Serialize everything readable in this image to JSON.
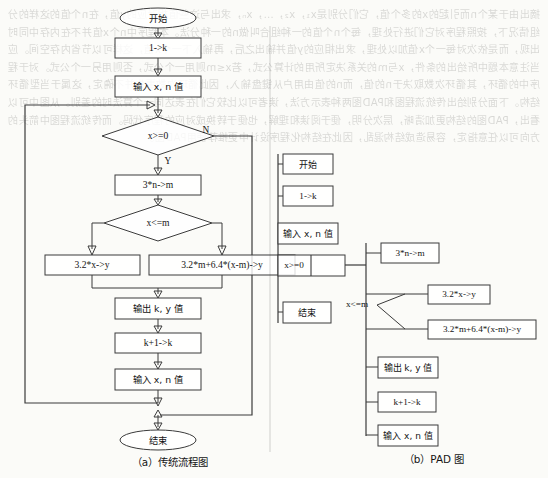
{
  "page": {
    "width": 548,
    "height": 478,
    "background_color": "#fbfbf8",
    "ink_color": "#3b3b3b",
    "bleed_through_text": "摘出由于某个n而引起的x的多个值，它们分别是x₁，x₂，…，xₙ，求出与这些值相对应的y值，在n个值的这样的分组情况下，按照程序对它们进行处理，每个n个值的一种组合叫做n的一种分法。本程序中n个x值并不在内存中同时出现，而是依次对每一个x值加以处理，求出相应的y值并输出之后，再输入下一个x值，这样可以节省内存空间。应当注意本题中所给出的条件，x与m的关系决定所用的计算公式，若x≤m则用一个公式，否则用另一个公式。对于程序中的循环，其循环次数取决于n的值，而n的值由用户从键盘输入，因此循环次数事先并不确定，这属于当型循环结构。下面分别给出传统流程图和PAD图两种表示方法，读者可以比较它们在表达同一个算法时的差别。从图中可以看出，PAD图的结构更加清晰，层次分明，便于阅读和理解，也便于转换成对应的程序代码。而传统流程图中箭头的方向可以任意指定，容易造成结构混乱，因此在结构化程序设计中更推荐使用PAD图。"
  },
  "flowchart": {
    "caption": "（a）传统流程图",
    "nodes": [
      {
        "id": "start",
        "shape": "terminator",
        "label": "开始",
        "lang": "cjk",
        "cx": 158,
        "cy": 18,
        "w": 76,
        "h": 20
      },
      {
        "id": "init",
        "shape": "process",
        "label": "1->k",
        "lang": "latin",
        "cx": 158,
        "cy": 48,
        "w": 86,
        "h": 20
      },
      {
        "id": "input1",
        "shape": "process",
        "label": "输入 x, n 值",
        "lang": "cjk",
        "cx": 158,
        "cy": 86,
        "w": 86,
        "h": 21
      },
      {
        "id": "cond1",
        "shape": "decision",
        "label": "x>=0",
        "lang": "latin",
        "cx": 158,
        "cy": 136,
        "w": 112,
        "h": 38
      },
      {
        "id": "calcm",
        "shape": "process",
        "label": "3*n->m",
        "lang": "latin",
        "cx": 158,
        "cy": 185,
        "w": 86,
        "h": 20
      },
      {
        "id": "cond2",
        "shape": "decision",
        "label": "x<=m",
        "lang": "latin",
        "cx": 158,
        "cy": 223,
        "w": 108,
        "h": 36
      },
      {
        "id": "calcy1",
        "shape": "process",
        "label": "3.2*x->y",
        "lang": "latin",
        "cx": 92,
        "cy": 265,
        "w": 95,
        "h": 20
      },
      {
        "id": "calcy2",
        "shape": "process",
        "label": "3.2*m+6.4*(x-m)->y",
        "lang": "latin",
        "cx": 222,
        "cy": 265,
        "w": 146,
        "h": 20
      },
      {
        "id": "output",
        "shape": "process",
        "label": "输出 k, y 值",
        "lang": "cjk",
        "cx": 158,
        "cy": 308,
        "w": 86,
        "h": 21
      },
      {
        "id": "incr",
        "shape": "process",
        "label": "k+1->k",
        "lang": "latin",
        "cx": 158,
        "cy": 343,
        "w": 86,
        "h": 20
      },
      {
        "id": "input2",
        "shape": "process",
        "label": "输入 x, n 值",
        "lang": "cjk",
        "cx": 158,
        "cy": 379,
        "w": 86,
        "h": 21
      },
      {
        "id": "end",
        "shape": "terminator",
        "label": "结束",
        "lang": "cjk",
        "cx": 158,
        "cy": 440,
        "w": 76,
        "h": 20
      }
    ],
    "branch_labels": [
      {
        "id": "branch-n",
        "text": "N",
        "x": 206,
        "y": 131
      },
      {
        "id": "branch-y",
        "text": "Y",
        "x": 168,
        "y": 162
      }
    ]
  },
  "pad": {
    "caption": "（b）PAD 图",
    "nodes": [
      {
        "id": "pad-start",
        "label": "开始",
        "lang": "cjk",
        "x": 283,
        "y": 154,
        "w": 50,
        "h": 20
      },
      {
        "id": "pad-init",
        "label": "1->k",
        "lang": "latin",
        "x": 283,
        "y": 186,
        "w": 50,
        "h": 20
      },
      {
        "id": "pad-input1",
        "label": "输入 x, n 值",
        "lang": "cjk",
        "x": 278,
        "y": 223,
        "w": 60,
        "h": 21
      },
      {
        "id": "pad-cond",
        "label": "x>=0",
        "lang": "latin",
        "x": 278,
        "y": 265,
        "w": 33,
        "h": 21
      },
      {
        "id": "pad-end",
        "label": "结束",
        "lang": "cjk",
        "x": 283,
        "y": 302,
        "w": 48,
        "h": 21
      },
      {
        "id": "pad-calcm",
        "label": "3*n->m",
        "lang": "latin",
        "x": 381,
        "y": 243,
        "w": 58,
        "h": 20
      },
      {
        "id": "pad-calcy1",
        "label": "3.2*x->y",
        "lang": "latin",
        "x": 428,
        "y": 285,
        "w": 62,
        "h": 19
      },
      {
        "id": "pad-calcy2",
        "label": "3.2*m+6.4*(x-m)->y",
        "lang": "latin",
        "x": 428,
        "y": 320,
        "w": 108,
        "h": 19
      },
      {
        "id": "pad-output",
        "label": "输出 k, y 值",
        "lang": "cjk",
        "x": 378,
        "y": 357,
        "w": 60,
        "h": 21
      },
      {
        "id": "pad-incr",
        "label": "k+1->k",
        "lang": "latin",
        "x": 378,
        "y": 392,
        "w": 58,
        "h": 20
      },
      {
        "id": "pad-input2",
        "label": "输入 x, n 值",
        "lang": "cjk",
        "x": 378,
        "y": 425,
        "w": 60,
        "h": 21
      }
    ],
    "selector_label": {
      "id": "pad-selector",
      "text": "x<=m",
      "x": 357,
      "y": 305
    }
  }
}
